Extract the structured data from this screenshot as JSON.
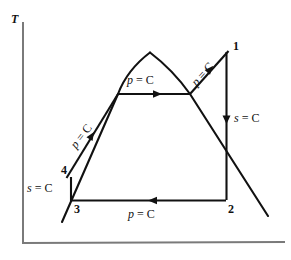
{
  "figure": {
    "type": "thermodynamic-cycle-diagram",
    "name": "T-s diagram of Rankine cycle with saturation dome",
    "background_color": "#ffffff",
    "line_color": "#111111",
    "axis_color": "#7a7a7a"
  },
  "axes": {
    "y_label": "T",
    "x_label": "",
    "origin": {
      "x": 23,
      "y": 243
    },
    "y_top": {
      "x": 23,
      "y": 22
    },
    "x_right": {
      "x": 285,
      "y": 242
    }
  },
  "states": [
    {
      "id": "1",
      "label": "1",
      "x": 228,
      "y": 51,
      "label_x": 233,
      "label_y": 41
    },
    {
      "id": "2",
      "label": "2",
      "x": 225,
      "y": 200,
      "label_x": 228,
      "label_y": 203
    },
    {
      "id": "3",
      "label": "3",
      "x": 71,
      "y": 200,
      "label_x": 74,
      "label_y": 203
    },
    {
      "id": "4",
      "label": "4",
      "x": 71,
      "y": 178,
      "label_x": 61,
      "label_y": 165
    }
  ],
  "process_labels": [
    {
      "id": "p-const-superheat",
      "text": "p = C",
      "variable": "p",
      "rest": " = C",
      "x": 192,
      "y": 74,
      "rotation": -48
    },
    {
      "id": "p-const-boiler",
      "text": "p = C",
      "variable": "p",
      "rest": " = C",
      "x": 127,
      "y": 75,
      "rotation": 0
    },
    {
      "id": "p-const-feed",
      "text": "p = C",
      "variable": "p",
      "rest": " = C",
      "x": 71,
      "y": 135,
      "rotation": -52
    },
    {
      "id": "p-const-condenser",
      "text": "p = C",
      "variable": "p",
      "rest": " = C",
      "x": 128,
      "y": 209,
      "rotation": 0
    },
    {
      "id": "s-const-turbine",
      "text": "s = C",
      "variable": "s",
      "rest": " = C",
      "x": 234,
      "y": 112,
      "rotation": 0
    },
    {
      "id": "s-const-pump",
      "text": "s = C",
      "variable": "s",
      "rest": " = C",
      "x": 28,
      "y": 182,
      "rotation": 0
    }
  ],
  "geometry": {
    "saturation_dome_left": "M 62 222 L 118 94 Q 128 70 150 53",
    "saturation_dome_right": "M 150 53 Q 172 70 190 94 L 268 216",
    "process_3_to_4": "M 71 200 L 71 178",
    "process_4_to_1": "M 66 178 L 118 94 L 190 94 L 228 51",
    "process_1_to_2": "M 226 51 L 226 200",
    "process_2_to_3": "M 225 200 L 71 200",
    "arrow_feedwater": {
      "x": 94,
      "y": 132,
      "angle": -58
    },
    "arrow_boiler": {
      "x": 160,
      "y": 94,
      "angle": 0
    },
    "arrow_superheat": {
      "x": 212,
      "y": 67,
      "angle": -48
    },
    "arrow_turbine": {
      "x": 226,
      "y": 122,
      "angle": 90
    },
    "arrow_condenser": {
      "x": 150,
      "y": 200,
      "angle": 180
    }
  }
}
